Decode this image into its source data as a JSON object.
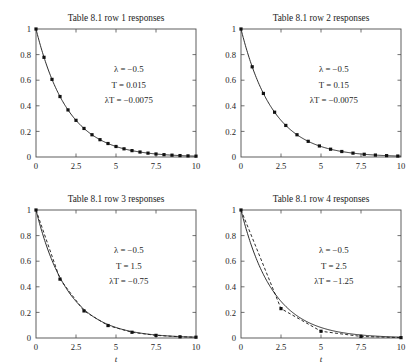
{
  "figure": {
    "name": "table-8-1-responses-figure",
    "background": "#ffffff",
    "layout": "2x2",
    "axis_color": "#4d4d4d",
    "curve_color": "#222222"
  },
  "chart_data": [
    {
      "type": "line",
      "panel_index": 1,
      "title": "Table 8.1 row 1 responses",
      "xlabel": "",
      "ylabel": "",
      "xlim": [
        0,
        10
      ],
      "ylim": [
        0,
        1
      ],
      "xticks": [
        0,
        2.5,
        5,
        7.5,
        10
      ],
      "xticklabels": [
        "0",
        "2.5",
        "5",
        "7.5",
        "10"
      ],
      "yticks": [
        0,
        0.2,
        0.4,
        0.6,
        0.8,
        1
      ],
      "yticklabels": [
        "0",
        "0.2",
        "0.4",
        "0.6",
        "0.8",
        "1"
      ],
      "grid": false,
      "legend": "none",
      "annotations": [
        {
          "lambda_label": "λ",
          "equals": " = ",
          "value": "−0.5"
        },
        {
          "lambda_label": "T",
          "equals": " = ",
          "value": "0.015"
        },
        {
          "lambda_label": "λT",
          "equals": " = ",
          "value": "−0.0075"
        }
      ],
      "annotation_lines": [
        "λ = −0.5",
        "T = 0.015",
        "λT = −0.0075"
      ],
      "params": {
        "lambda": -0.5,
        "T": 0.015,
        "lambdaT": -0.0075
      },
      "series": [
        {
          "name": "continuous response",
          "style": "solid",
          "model": "exp",
          "decay": 0.5,
          "x": [
            0,
            0.25,
            0.5,
            0.75,
            1,
            1.5,
            2,
            2.5,
            3,
            3.5,
            4,
            4.5,
            5,
            5.5,
            6,
            6.5,
            7,
            7.5,
            8,
            8.5,
            9,
            9.5,
            10
          ],
          "values": [
            1,
            0.8825,
            0.7788,
            0.6873,
            0.6065,
            0.4724,
            0.3679,
            0.2865,
            0.2231,
            0.1738,
            0.1353,
            0.1054,
            0.0821,
            0.0639,
            0.0498,
            0.0388,
            0.0302,
            0.0235,
            0.0183,
            0.0143,
            0.0111,
            0.0087,
            0.0067
          ]
        },
        {
          "name": "discrete response",
          "style": "markers",
          "marker": "square",
          "sample_interval": 0.5,
          "x": [
            0,
            0.5,
            1,
            1.5,
            2,
            2.5,
            3,
            3.5,
            4,
            4.5,
            5,
            5.5,
            6,
            6.5,
            7,
            7.5,
            8,
            8.5,
            9,
            9.5,
            10
          ],
          "values": [
            1,
            0.7788,
            0.6065,
            0.4724,
            0.3679,
            0.2865,
            0.2231,
            0.1738,
            0.1353,
            0.1054,
            0.0821,
            0.0639,
            0.0498,
            0.0388,
            0.0302,
            0.0235,
            0.0183,
            0.0143,
            0.0111,
            0.0087,
            0.0067
          ]
        }
      ]
    },
    {
      "type": "line",
      "panel_index": 2,
      "title": "Table 8.1 row 2 responses",
      "xlabel": "",
      "ylabel": "",
      "xlim": [
        0,
        10
      ],
      "ylim": [
        0,
        1
      ],
      "xticks": [
        0,
        2.5,
        5,
        7.5,
        10
      ],
      "xticklabels": [
        "0",
        "2.5",
        "5",
        "7.5",
        "10"
      ],
      "yticks": [
        0,
        0.2,
        0.4,
        0.6,
        0.8,
        1
      ],
      "yticklabels": [
        "0",
        "0.2",
        "0.4",
        "0.6",
        "0.8",
        "1"
      ],
      "grid": false,
      "legend": "none",
      "annotation_lines": [
        "λ = −0.5",
        "T = 0.15",
        "λT = −0.0075"
      ],
      "params": {
        "lambda": -0.5,
        "T": 0.15,
        "lambdaT": -0.0075
      },
      "series": [
        {
          "name": "continuous response",
          "style": "solid",
          "model": "exp",
          "decay": 0.5,
          "x": [
            0,
            0.35,
            0.7,
            1.05,
            1.4,
            2.1,
            2.8,
            3.5,
            4.2,
            4.9,
            5.6,
            6.3,
            7,
            7.7,
            8.4,
            9.1,
            9.8,
            10
          ],
          "values": [
            1,
            0.8395,
            0.7047,
            0.5916,
            0.4966,
            0.3499,
            0.2466,
            0.1738,
            0.1225,
            0.0863,
            0.0608,
            0.0429,
            0.0302,
            0.0213,
            0.015,
            0.0106,
            0.0074,
            0.0067
          ]
        },
        {
          "name": "discrete response",
          "style": "markers",
          "marker": "square",
          "sample_interval": 0.7,
          "x": [
            0,
            0.7,
            1.4,
            2.1,
            2.8,
            3.5,
            4.2,
            4.9,
            5.6,
            6.3,
            7,
            7.7,
            8.4,
            9.1,
            9.8
          ],
          "values": [
            1,
            0.7047,
            0.4966,
            0.3499,
            0.2466,
            0.1738,
            0.1225,
            0.0863,
            0.0608,
            0.0429,
            0.0302,
            0.0213,
            0.015,
            0.0106,
            0.0074
          ]
        }
      ]
    },
    {
      "type": "line",
      "panel_index": 3,
      "title": "Table 8.1 row 3 responses",
      "xlabel": "t",
      "ylabel": "",
      "xlim": [
        0,
        10
      ],
      "ylim": [
        0,
        1
      ],
      "xticks": [
        0,
        2.5,
        5,
        7.5,
        10
      ],
      "xticklabels": [
        "0",
        "2.5",
        "5",
        "7.5",
        "10"
      ],
      "yticks": [
        0,
        0.2,
        0.4,
        0.6,
        0.8,
        1
      ],
      "yticklabels": [
        "0",
        "0.2",
        "0.4",
        "0.6",
        "0.8",
        "1"
      ],
      "grid": false,
      "legend": "none",
      "annotation_lines": [
        "λ = −0.5",
        "T = 1.5",
        "λT = −0.75"
      ],
      "params": {
        "lambda": -0.5,
        "T": 1.5,
        "lambdaT": -0.75
      },
      "series": [
        {
          "name": "continuous response",
          "style": "solid",
          "model": "exp",
          "decay": 0.5,
          "x": [
            0,
            0.5,
            1,
            1.5,
            2,
            2.5,
            3,
            3.5,
            4,
            4.5,
            5,
            6,
            7,
            8,
            9,
            10
          ],
          "values": [
            1,
            0.7788,
            0.6065,
            0.4724,
            0.3679,
            0.2865,
            0.2231,
            0.1738,
            0.1353,
            0.1054,
            0.0821,
            0.0498,
            0.0302,
            0.0183,
            0.0111,
            0.0067
          ]
        },
        {
          "name": "discrete response",
          "style": "dashed-markers",
          "marker": "square",
          "sample_interval": 1.5,
          "x": [
            0,
            1.5,
            3,
            4.5,
            6,
            7.5,
            9,
            10
          ],
          "values": [
            1,
            0.46,
            0.2116,
            0.0973,
            0.0448,
            0.0206,
            0.0095,
            0.0063
          ]
        }
      ]
    },
    {
      "type": "line",
      "panel_index": 4,
      "title": "Table 8.1 row 4 responses",
      "xlabel": "t",
      "ylabel": "",
      "xlim": [
        0,
        10
      ],
      "ylim": [
        0,
        1
      ],
      "xticks": [
        0,
        2.5,
        5,
        7.5,
        10
      ],
      "xticklabels": [
        "0",
        "2.5",
        "5",
        "7.5",
        "10"
      ],
      "yticks": [
        0,
        0.2,
        0.4,
        0.6,
        0.8,
        1
      ],
      "yticklabels": [
        "0",
        "0.2",
        "0.4",
        "0.6",
        "0.8",
        "1"
      ],
      "grid": false,
      "legend": "none",
      "annotation_lines": [
        "λ = −0.5",
        "T = 2.5",
        "λT = −1.25"
      ],
      "params": {
        "lambda": -0.5,
        "T": 2.5,
        "lambdaT": -1.25
      },
      "series": [
        {
          "name": "continuous response",
          "style": "solid",
          "model": "exp",
          "decay": 0.5,
          "x": [
            0,
            0.5,
            1,
            1.5,
            2,
            2.5,
            3,
            3.5,
            4,
            4.5,
            5,
            6,
            7,
            8,
            9,
            10
          ],
          "values": [
            1,
            0.7788,
            0.6065,
            0.4724,
            0.3679,
            0.2865,
            0.2231,
            0.1738,
            0.1353,
            0.1054,
            0.0821,
            0.0498,
            0.0302,
            0.0183,
            0.0111,
            0.0067
          ]
        },
        {
          "name": "discrete response",
          "style": "dashed-markers",
          "marker": "square",
          "sample_interval": 2.5,
          "x": [
            0,
            2.5,
            5,
            7.5,
            10
          ],
          "values": [
            1,
            0.2296,
            0.0527,
            0.0121,
            0.0028
          ]
        }
      ]
    }
  ]
}
